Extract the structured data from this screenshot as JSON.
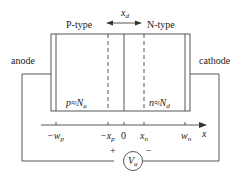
{
  "diagram": {
    "labels": {
      "p_region": "P-type",
      "n_region": "N-type",
      "depletion_width": "x",
      "depletion_width_sub": "d",
      "anode": "anode",
      "cathode": "cathode",
      "p_conc": "p≈N",
      "p_conc_sub": "a",
      "n_conc": "n≈N",
      "n_conc_sub": "d",
      "source": "V",
      "source_sub": "a",
      "plus": "+",
      "minus": "−"
    },
    "axis": {
      "label": "x",
      "ticks": [
        {
          "label": "−w",
          "sub": "p"
        },
        {
          "label": "−x",
          "sub": "p"
        },
        {
          "label": "0",
          "sub": ""
        },
        {
          "label": "x",
          "sub": "n"
        },
        {
          "label": "w",
          "sub": "n"
        }
      ]
    }
  }
}
